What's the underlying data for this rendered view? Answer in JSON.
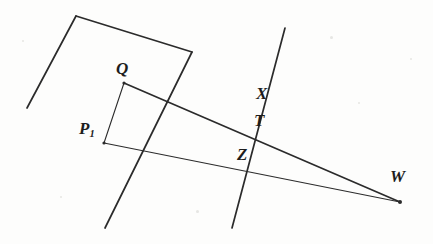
{
  "figure": {
    "kind": "geometry-diagram",
    "width": 433,
    "height": 244,
    "background_color": "#fdfdfc",
    "ink_color": "#2b2b2b",
    "labels": [
      {
        "id": "Q",
        "text": "Q",
        "sub": "",
        "x": 116,
        "y": 60,
        "size": 17
      },
      {
        "id": "P1",
        "text": "P",
        "sub": "1",
        "x": 79,
        "y": 120,
        "size": 17
      },
      {
        "id": "X",
        "text": "X",
        "sub": "",
        "x": 256,
        "y": 85,
        "size": 17
      },
      {
        "id": "T",
        "text": "T",
        "sub": "",
        "x": 254,
        "y": 112,
        "size": 17
      },
      {
        "id": "Z",
        "text": "Z",
        "sub": "",
        "x": 237,
        "y": 146,
        "size": 17
      },
      {
        "id": "W",
        "text": "W",
        "sub": "",
        "x": 390,
        "y": 168,
        "size": 17
      }
    ],
    "points": [
      {
        "id": "Q",
        "x": 124,
        "y": 83
      },
      {
        "id": "P1",
        "x": 104,
        "y": 143
      },
      {
        "id": "W",
        "x": 400,
        "y": 202
      },
      {
        "id": "T",
        "x": 265,
        "y": 135
      },
      {
        "id": "Z",
        "x": 251,
        "y": 170
      }
    ],
    "segments": [
      {
        "id": "quad-left-edge",
        "x1": 27,
        "y1": 108,
        "x2": 76,
        "y2": 16,
        "weight": 1.7
      },
      {
        "id": "quad-top-edge",
        "x1": 76,
        "y1": 16,
        "x2": 192,
        "y2": 52,
        "weight": 1.7
      },
      {
        "id": "transversal-left",
        "x1": 192,
        "y1": 52,
        "x2": 105,
        "y2": 228,
        "weight": 1.7
      },
      {
        "id": "transversal-right",
        "x1": 285,
        "y1": 28,
        "x2": 232,
        "y2": 228,
        "weight": 1.7
      },
      {
        "id": "ray-Q-to-W",
        "x1": 124,
        "y1": 83,
        "x2": 400,
        "y2": 202,
        "weight": 1.7
      },
      {
        "id": "ray-P1-to-W",
        "x1": 104,
        "y1": 143,
        "x2": 400,
        "y2": 202,
        "weight": 1.1
      },
      {
        "id": "segment-P1-to-Q",
        "x1": 104,
        "y1": 143,
        "x2": 124,
        "y2": 83,
        "weight": 1.1
      }
    ],
    "dots": [
      {
        "id": "dot-Q",
        "x": 124,
        "y": 83,
        "r": 1.6
      },
      {
        "id": "dot-P1",
        "x": 104,
        "y": 143,
        "r": 1.6
      },
      {
        "id": "dot-W",
        "x": 400,
        "y": 202,
        "r": 2.0
      }
    ],
    "specks": [
      {
        "x": 330,
        "y": 36,
        "d": 3
      },
      {
        "x": 358,
        "y": 102,
        "d": 2
      },
      {
        "x": 60,
        "y": 196,
        "d": 2
      },
      {
        "x": 196,
        "y": 210,
        "d": 3
      },
      {
        "x": 410,
        "y": 58,
        "d": 2
      },
      {
        "x": 22,
        "y": 40,
        "d": 2
      }
    ]
  }
}
